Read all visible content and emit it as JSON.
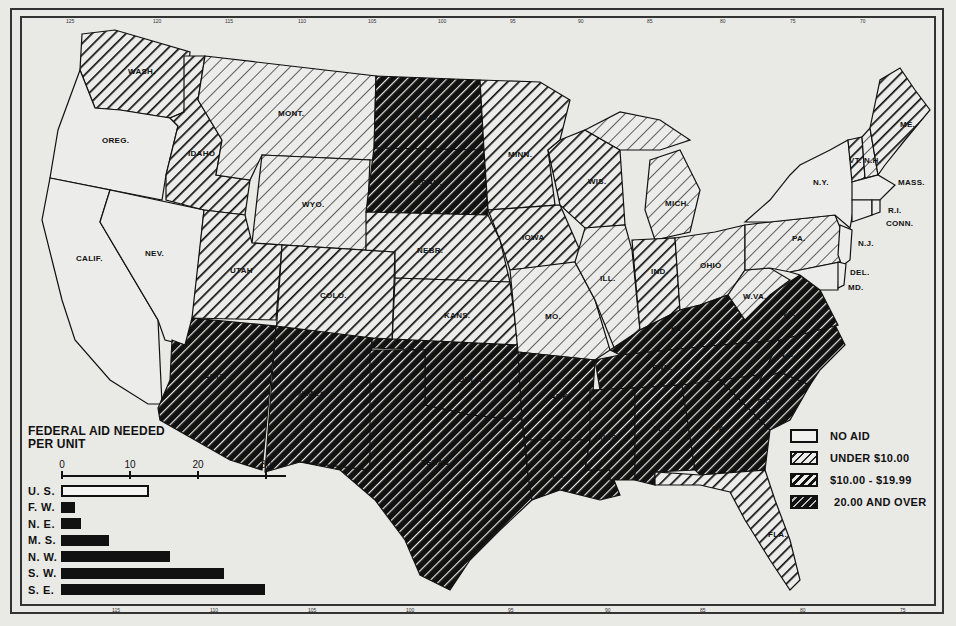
{
  "legend": {
    "items": [
      {
        "key": "none",
        "label": "NO AID"
      },
      {
        "key": "under10",
        "label": "UNDER $10.00"
      },
      {
        "key": "mid",
        "label": "$10.00 - $19.99"
      },
      {
        "key": "high",
        "label": "20.00 AND OVER"
      }
    ]
  },
  "inset": {
    "title_line1": "FEDERAL AID NEEDED",
    "title_line2": "PER UNIT"
  },
  "border_ticks": {
    "top": [
      "125",
      "120",
      "115",
      "110",
      "105",
      "100",
      "95",
      "90",
      "85",
      "80",
      "75",
      "70"
    ],
    "bottom": [
      "115",
      "110",
      "105",
      "100",
      "95",
      "90",
      "85",
      "80",
      "75"
    ],
    "left": [
      "45",
      "40",
      "35",
      "30",
      "25"
    ],
    "right": [
      "45",
      "40",
      "35",
      "30",
      "25"
    ]
  },
  "states": [
    {
      "abbr": "WASH.",
      "category": "mid"
    },
    {
      "abbr": "OREG.",
      "category": "none"
    },
    {
      "abbr": "CALIF.",
      "category": "none"
    },
    {
      "abbr": "NEV.",
      "category": "none"
    },
    {
      "abbr": "IDAHO",
      "category": "mid"
    },
    {
      "abbr": "MONT.",
      "category": "under10"
    },
    {
      "abbr": "WYO.",
      "category": "under10"
    },
    {
      "abbr": "UTAH",
      "category": "mid"
    },
    {
      "abbr": "COLO.",
      "category": "mid"
    },
    {
      "abbr": "ARIZ.",
      "category": "high"
    },
    {
      "abbr": "N.MEX.",
      "category": "high"
    },
    {
      "abbr": "N.DAK.",
      "category": "high"
    },
    {
      "abbr": "S.DAK.",
      "category": "high"
    },
    {
      "abbr": "NEBR.",
      "category": "mid"
    },
    {
      "abbr": "KANS.",
      "category": "mid"
    },
    {
      "abbr": "OKLA.",
      "category": "high"
    },
    {
      "abbr": "TEXAS",
      "category": "high"
    },
    {
      "abbr": "MINN.",
      "category": "mid"
    },
    {
      "abbr": "IOWA",
      "category": "mid"
    },
    {
      "abbr": "MO.",
      "category": "under10"
    },
    {
      "abbr": "ARK.",
      "category": "high"
    },
    {
      "abbr": "LA.",
      "category": "high"
    },
    {
      "abbr": "WIS.",
      "category": "mid"
    },
    {
      "abbr": "ILL.",
      "category": "under10"
    },
    {
      "abbr": "MICH.",
      "category": "under10"
    },
    {
      "abbr": "IND.",
      "category": "mid"
    },
    {
      "abbr": "OHIO",
      "category": "under10"
    },
    {
      "abbr": "KY.",
      "category": "high"
    },
    {
      "abbr": "TENN.",
      "category": "high"
    },
    {
      "abbr": "MISS.",
      "category": "high"
    },
    {
      "abbr": "ALA.",
      "category": "high"
    },
    {
      "abbr": "GA.",
      "category": "high"
    },
    {
      "abbr": "FLA.",
      "category": "mid"
    },
    {
      "abbr": "S.C.",
      "category": "high"
    },
    {
      "abbr": "N.C.",
      "category": "high"
    },
    {
      "abbr": "VA.",
      "category": "high"
    },
    {
      "abbr": "W.VA.",
      "category": "under10"
    },
    {
      "abbr": "PA.",
      "category": "under10"
    },
    {
      "abbr": "N.Y.",
      "category": "none"
    },
    {
      "abbr": "N.J.",
      "category": "none"
    },
    {
      "abbr": "DEL.",
      "category": "none"
    },
    {
      "abbr": "MD.",
      "category": "none"
    },
    {
      "abbr": "VT.",
      "category": "mid"
    },
    {
      "abbr": "N.H.",
      "category": "under10"
    },
    {
      "abbr": "ME.",
      "category": "mid"
    },
    {
      "abbr": "MASS.",
      "category": "none"
    },
    {
      "abbr": "R.I.",
      "category": "none"
    },
    {
      "abbr": "CONN.",
      "category": "none"
    }
  ],
  "chart_data": {
    "type": "bar",
    "orientation": "horizontal",
    "title": "FEDERAL AID NEEDED PER UNIT",
    "categories": [
      "U. S.",
      "F. W.",
      "N. E.",
      "M. S.",
      "N. W.",
      "S. W.",
      "S. E."
    ],
    "values": [
      13,
      2,
      3,
      7,
      16,
      24,
      30
    ],
    "highlight": {
      "U. S.": "outline"
    },
    "xlabel": "",
    "ylabel": "",
    "xticks": [
      0,
      10,
      20,
      30
    ],
    "xlim": [
      0,
      33
    ],
    "grid": false,
    "legend": "none"
  }
}
